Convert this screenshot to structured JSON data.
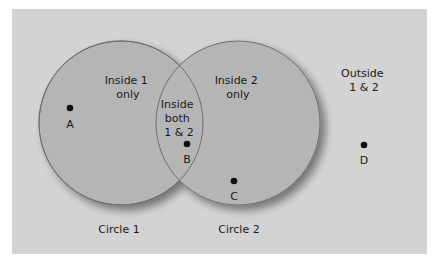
{
  "diagram": {
    "type": "venn",
    "colors": {
      "background": "#d3d3d3",
      "circle_fill": "#b5b5b5",
      "circle_stroke": "#6e6e6e",
      "point": "#111111",
      "text": "#1a1a1a"
    },
    "regions": {
      "inside_1_only": [
        "Inside 1",
        "only"
      ],
      "inside_2_only": [
        "Inside 2",
        "only"
      ],
      "inside_both": [
        "Inside",
        "both",
        "1 & 2"
      ],
      "outside": [
        "Outside",
        "1 & 2"
      ]
    },
    "circles": [
      {
        "label": "Circle 1"
      },
      {
        "label": "Circle 2"
      }
    ],
    "points": [
      {
        "label": "A",
        "region": "inside 1 only"
      },
      {
        "label": "B",
        "region": "inside both 1 & 2"
      },
      {
        "label": "C",
        "region": "inside 2 only"
      },
      {
        "label": "D",
        "region": "outside 1 & 2"
      }
    ]
  }
}
